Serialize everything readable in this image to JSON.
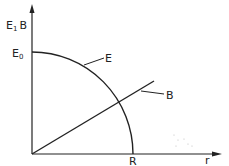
{
  "diagram": {
    "axes": {
      "y_label_main": "E",
      "y_label_sep": "1",
      "y_label_second": "B",
      "x_label": "r"
    },
    "markers": {
      "y_intercept_main": "E",
      "y_intercept_sub": "0",
      "x_intercept": "R"
    },
    "curves": [
      {
        "name": "E",
        "label": "E",
        "shape": "quarter-ellipse from E0 on vertical axis down to R on horizontal axis"
      },
      {
        "name": "B",
        "label": "B",
        "shape": "straight line rising linearly from origin"
      }
    ],
    "colors": {
      "ink": "#222222",
      "background": "#ffffff"
    }
  }
}
